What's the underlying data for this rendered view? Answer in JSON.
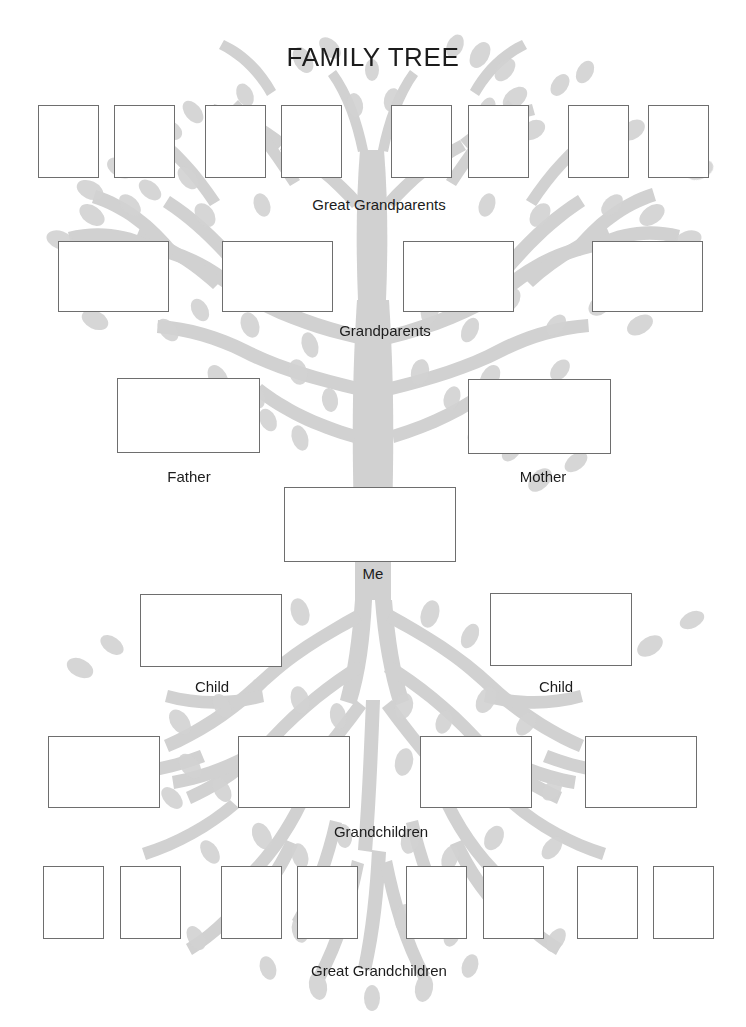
{
  "page": {
    "title": "FAMILY TREE",
    "background_color": "#ffffff",
    "tree_color": "#c9c9c9",
    "box_border_color": "#6e6e6e",
    "text_color": "#1c1c1c",
    "width": 746,
    "height": 1027
  },
  "tiers": [
    {
      "id": "great-grandparents",
      "label": "Great Grandparents",
      "label_x": 379,
      "label_y": 196,
      "boxes": [
        {
          "value": "",
          "x": 38,
          "y": 105,
          "w": 61,
          "h": 73
        },
        {
          "value": "",
          "x": 114,
          "y": 105,
          "w": 61,
          "h": 73
        },
        {
          "value": "",
          "x": 205,
          "y": 105,
          "w": 61,
          "h": 73
        },
        {
          "value": "",
          "x": 281,
          "y": 105,
          "w": 61,
          "h": 73
        },
        {
          "value": "",
          "x": 391,
          "y": 105,
          "w": 61,
          "h": 73
        },
        {
          "value": "",
          "x": 468,
          "y": 105,
          "w": 61,
          "h": 73
        },
        {
          "value": "",
          "x": 568,
          "y": 105,
          "w": 61,
          "h": 73
        },
        {
          "value": "",
          "x": 648,
          "y": 105,
          "w": 61,
          "h": 73
        }
      ]
    },
    {
      "id": "grandparents",
      "label": "Grandparents",
      "label_x": 385,
      "label_y": 322,
      "boxes": [
        {
          "value": "",
          "x": 58,
          "y": 241,
          "w": 111,
          "h": 71
        },
        {
          "value": "",
          "x": 222,
          "y": 241,
          "w": 111,
          "h": 71
        },
        {
          "value": "",
          "x": 403,
          "y": 241,
          "w": 111,
          "h": 71
        },
        {
          "value": "",
          "x": 592,
          "y": 241,
          "w": 111,
          "h": 71
        }
      ]
    },
    {
      "id": "parents",
      "label": null,
      "boxes": [
        {
          "value": "",
          "x": 117,
          "y": 378,
          "w": 143,
          "h": 75,
          "label": "Father",
          "label_x": 189,
          "label_y": 468
        },
        {
          "value": "",
          "x": 468,
          "y": 379,
          "w": 143,
          "h": 75,
          "label": "Mother",
          "label_x": 543,
          "label_y": 468
        }
      ]
    },
    {
      "id": "self",
      "label": "Me",
      "label_x": 373,
      "label_y": 565,
      "boxes": [
        {
          "value": "",
          "x": 284,
          "y": 487,
          "w": 172,
          "h": 75
        }
      ]
    },
    {
      "id": "children",
      "label": null,
      "boxes": [
        {
          "value": "",
          "x": 140,
          "y": 594,
          "w": 142,
          "h": 73,
          "label": "Child",
          "label_x": 212,
          "label_y": 678
        },
        {
          "value": "",
          "x": 490,
          "y": 593,
          "w": 142,
          "h": 73,
          "label": "Child",
          "label_x": 556,
          "label_y": 678
        }
      ]
    },
    {
      "id": "grandchildren",
      "label": "Grandchildren",
      "label_x": 381,
      "label_y": 823,
      "boxes": [
        {
          "value": "",
          "x": 48,
          "y": 736,
          "w": 112,
          "h": 72
        },
        {
          "value": "",
          "x": 238,
          "y": 736,
          "w": 112,
          "h": 72
        },
        {
          "value": "",
          "x": 420,
          "y": 736,
          "w": 112,
          "h": 72
        },
        {
          "value": "",
          "x": 585,
          "y": 736,
          "w": 112,
          "h": 72
        }
      ]
    },
    {
      "id": "great-grandchildren",
      "label": "Great Grandchildren",
      "label_x": 379,
      "label_y": 962,
      "boxes": [
        {
          "value": "",
          "x": 43,
          "y": 866,
          "w": 61,
          "h": 73
        },
        {
          "value": "",
          "x": 120,
          "y": 866,
          "w": 61,
          "h": 73
        },
        {
          "value": "",
          "x": 221,
          "y": 866,
          "w": 61,
          "h": 73
        },
        {
          "value": "",
          "x": 297,
          "y": 866,
          "w": 61,
          "h": 73
        },
        {
          "value": "",
          "x": 406,
          "y": 866,
          "w": 61,
          "h": 73
        },
        {
          "value": "",
          "x": 483,
          "y": 866,
          "w": 61,
          "h": 73
        },
        {
          "value": "",
          "x": 577,
          "y": 866,
          "w": 61,
          "h": 73
        },
        {
          "value": "",
          "x": 653,
          "y": 866,
          "w": 61,
          "h": 73
        }
      ]
    }
  ]
}
